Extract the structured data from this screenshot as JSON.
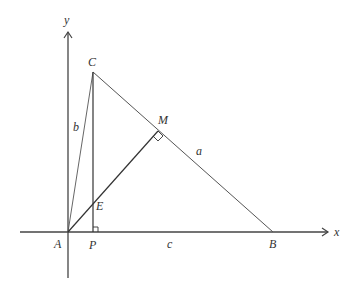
{
  "diagram": {
    "axes": {
      "x_label": "x",
      "y_label": "y"
    },
    "points": {
      "A": "A",
      "B": "B",
      "C": "C",
      "P": "P",
      "M": "M",
      "E": "E"
    },
    "sides": {
      "a": "a",
      "b": "b",
      "c": "c"
    },
    "colors": {
      "line": "#333333",
      "axis": "#444444",
      "background": "#ffffff"
    }
  }
}
